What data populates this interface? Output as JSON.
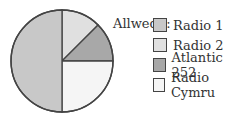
{
  "chart_data": {
    "type": "pie",
    "title": "",
    "legend_title": "Allwedd:",
    "legend_position": "right",
    "categories": [
      "Radio 1",
      "Radio 2",
      "Atlantic 252",
      "Radio Cymru"
    ],
    "values": [
      50,
      12.5,
      12.5,
      25
    ],
    "colors": [
      "#c8c8c8",
      "#e0e0e0",
      "#a8a8a8",
      "#f5f5f5"
    ]
  },
  "legend": {
    "title": "Allwedd:",
    "items": [
      {
        "label": "Radio 1",
        "color": "#c8c8c8"
      },
      {
        "label": "Radio 2",
        "color": "#e0e0e0"
      },
      {
        "label": "Atlantic 252",
        "color": "#a8a8a8"
      },
      {
        "label": "Radio Cymru",
        "color": "#f5f5f5"
      }
    ]
  }
}
